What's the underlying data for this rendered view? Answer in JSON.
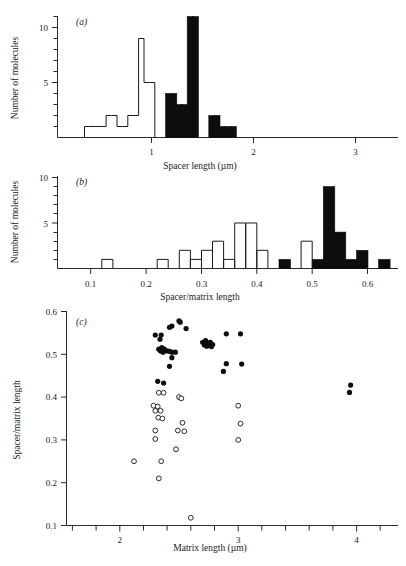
{
  "figure": {
    "title": "",
    "panels": [
      "a",
      "b",
      "c"
    ]
  },
  "chart_data": [
    {
      "panel": "a",
      "panel_label": "(a)",
      "type": "bar",
      "subtype": "histogram",
      "title": "",
      "xlabel": "Spacer length (µm)",
      "ylabel": "Number of molecules",
      "xlim": [
        0.2,
        3.35
      ],
      "ylim": [
        0,
        11.6
      ],
      "xticks": [
        1,
        2,
        3
      ],
      "xticklabels": [
        "1",
        "2",
        "3"
      ],
      "yticks": [
        5,
        10
      ],
      "yticklabels": [
        "5",
        "10"
      ],
      "yminorticks": [
        1,
        2,
        3,
        4,
        6,
        7,
        8,
        9,
        11
      ],
      "grid": false,
      "legend": null,
      "bin_width": 0.05,
      "series": [
        {
          "name": "open",
          "style": "unfilled",
          "bin_starts": [
            0.45,
            0.5,
            0.55,
            0.6,
            0.65,
            0.7,
            0.75,
            0.8,
            0.85,
            0.9,
            0.95,
            1.0,
            1.05
          ],
          "values": [
            1,
            1,
            1,
            1,
            2,
            2,
            1,
            1,
            2,
            2,
            9,
            5,
            5
          ]
        },
        {
          "name": "filled",
          "style": "filled",
          "bin_starts": [
            1.2,
            1.25,
            1.3,
            1.35,
            1.4,
            1.45,
            1.5,
            1.6,
            1.65,
            1.7,
            1.75,
            1.8
          ],
          "values": [
            4,
            4,
            3,
            3,
            11,
            11,
            0,
            2,
            2,
            1,
            1,
            1
          ]
        }
      ]
    },
    {
      "panel": "b",
      "panel_label": "(b)",
      "type": "bar",
      "subtype": "histogram",
      "title": "",
      "xlabel": "Spacer/matrix length",
      "ylabel": "Number of molecules",
      "xlim": [
        0.04,
        0.655
      ],
      "ylim": [
        0,
        10.6
      ],
      "xticks": [
        0.1,
        0.2,
        0.3,
        0.4,
        0.5,
        0.6
      ],
      "xticklabels": [
        "0.1",
        "0.2",
        "0.3",
        "0.4",
        "0.5",
        "0.6"
      ],
      "yticks": [
        5,
        10
      ],
      "yticklabels": [
        "5",
        "10"
      ],
      "yminorticks": [
        1,
        2,
        3,
        4,
        6,
        7,
        8,
        9
      ],
      "grid": false,
      "legend": null,
      "bin_width": 0.02,
      "series": [
        {
          "name": "open",
          "style": "unfilled",
          "bin_starts": [
            0.12,
            0.22,
            0.26,
            0.28,
            0.3,
            0.32,
            0.34,
            0.36,
            0.38,
            0.4,
            0.48
          ],
          "values": [
            1,
            1,
            2,
            1,
            2,
            3,
            1,
            5,
            5,
            2,
            3
          ]
        },
        {
          "name": "filled",
          "style": "filled",
          "bin_starts": [
            0.44,
            0.5,
            0.52,
            0.54,
            0.56,
            0.58,
            0.62
          ],
          "values": [
            1,
            1,
            9,
            4,
            1,
            2,
            1
          ]
        }
      ]
    },
    {
      "panel": "c",
      "panel_label": "(c)",
      "type": "scatter",
      "title": "",
      "xlabel": "Matrix length (µm)",
      "ylabel": "Spacer/matrix length",
      "xlim": [
        1.55,
        4.35
      ],
      "ylim": [
        0.1,
        0.6
      ],
      "xticks": [
        2,
        3,
        4
      ],
      "xticklabels": [
        "2",
        "3",
        "4"
      ],
      "xminorticks": [
        1.6,
        1.8,
        2.2,
        2.4,
        2.6,
        2.8,
        3.2,
        3.4,
        3.6,
        3.8,
        4.2
      ],
      "yticks": [
        0.1,
        0.2,
        0.3,
        0.4,
        0.5,
        0.6
      ],
      "yticklabels": [
        "0.1",
        "0.2",
        "0.3",
        "0.4",
        "0.5",
        "0.6"
      ],
      "grid": false,
      "legend": null,
      "series": [
        {
          "name": "filled-circles",
          "marker": "filled-circle",
          "points": [
            [
              2.3,
              0.545
            ],
            [
              2.34,
              0.535
            ],
            [
              2.35,
              0.545
            ],
            [
              2.42,
              0.563
            ],
            [
              2.44,
              0.566
            ],
            [
              2.5,
              0.578
            ],
            [
              2.51,
              0.575
            ],
            [
              2.56,
              0.56
            ],
            [
              2.33,
              0.512
            ],
            [
              2.345,
              0.508
            ],
            [
              2.355,
              0.516
            ],
            [
              2.365,
              0.505
            ],
            [
              2.375,
              0.512
            ],
            [
              2.4,
              0.508
            ],
            [
              2.42,
              0.507
            ],
            [
              2.44,
              0.505
            ],
            [
              2.47,
              0.505
            ],
            [
              2.44,
              0.492
            ],
            [
              2.7,
              0.528
            ],
            [
              2.715,
              0.522
            ],
            [
              2.725,
              0.532
            ],
            [
              2.735,
              0.519
            ],
            [
              2.745,
              0.526
            ],
            [
              2.755,
              0.521
            ],
            [
              2.765,
              0.528
            ],
            [
              2.775,
              0.518
            ],
            [
              2.785,
              0.523
            ],
            [
              2.9,
              0.548
            ],
            [
              3.02,
              0.548
            ],
            [
              2.42,
              0.472
            ],
            [
              2.32,
              0.437
            ],
            [
              2.37,
              0.433
            ],
            [
              2.9,
              0.478
            ],
            [
              3.03,
              0.477
            ],
            [
              2.875,
              0.46
            ],
            [
              3.95,
              0.428
            ],
            [
              3.94,
              0.411
            ]
          ]
        },
        {
          "name": "open-circles",
          "marker": "open-circle",
          "points": [
            [
              2.33,
              0.41
            ],
            [
              2.37,
              0.41
            ],
            [
              2.5,
              0.4
            ],
            [
              2.52,
              0.397
            ],
            [
              2.285,
              0.38
            ],
            [
              2.32,
              0.378
            ],
            [
              2.3,
              0.368
            ],
            [
              2.345,
              0.368
            ],
            [
              2.325,
              0.352
            ],
            [
              2.36,
              0.35
            ],
            [
              2.3,
              0.322
            ],
            [
              2.49,
              0.322
            ],
            [
              2.545,
              0.32
            ],
            [
              2.3,
              0.302
            ],
            [
              2.53,
              0.34
            ],
            [
              3.02,
              0.338
            ],
            [
              3.0,
              0.38
            ],
            [
              3.0,
              0.3
            ],
            [
              2.475,
              0.278
            ],
            [
              2.12,
              0.25
            ],
            [
              2.35,
              0.25
            ],
            [
              2.33,
              0.21
            ],
            [
              2.6,
              0.118
            ]
          ]
        }
      ]
    }
  ]
}
